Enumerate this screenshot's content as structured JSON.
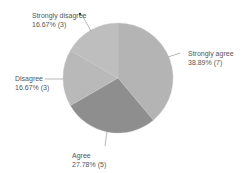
{
  "chart_data": {
    "type": "pie",
    "title": "",
    "categories": [
      "Strongly agree",
      "Agree",
      "Disagree",
      "Strongly disagree"
    ],
    "values": [
      7,
      5,
      3,
      3
    ],
    "percentages": [
      38.89,
      27.78,
      16.67,
      16.67
    ],
    "labels": [
      {
        "name": "Strongly agree",
        "value_text": "38.89% (7)"
      },
      {
        "name": "Agree",
        "value_text": "27.78% (5)"
      },
      {
        "name": "Disagree",
        "value_text": "16.67% (3)"
      },
      {
        "name": "Strongly disagree",
        "value_text": "16.67% (3)"
      }
    ],
    "colors": [
      "#b4b4b4",
      "#8e8e8e",
      "#b9b9b9",
      "#bebebe"
    ],
    "start_angle_deg": 0,
    "direction": "clockwise",
    "legend": "none",
    "data_labels": "outside with leader lines"
  }
}
